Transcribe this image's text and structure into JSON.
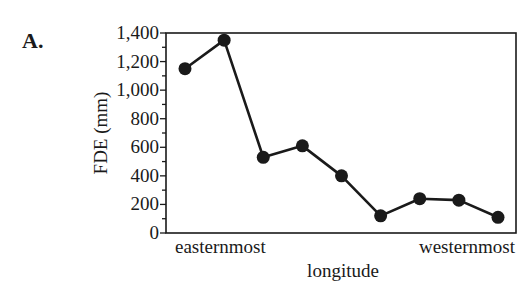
{
  "panel_label": "A.",
  "chart_data": {
    "type": "line",
    "title": "",
    "xlabel": "longitude",
    "ylabel": "FDE (mm)",
    "x_endpoint_labels": {
      "left": "easternmost",
      "right": "westernmost"
    },
    "x": [
      1,
      2,
      3,
      4,
      5,
      6,
      7,
      8,
      9
    ],
    "values": [
      1150,
      1350,
      530,
      610,
      400,
      120,
      240,
      230,
      110
    ],
    "ylim": [
      0,
      1400
    ],
    "yticks": [
      0,
      200,
      400,
      600,
      800,
      1000,
      1200,
      1400
    ],
    "ytick_labels": [
      "0",
      "200",
      "400",
      "600",
      "800",
      "1,000",
      "1,200",
      "1,400"
    ],
    "minor_ytick_step": 100,
    "grid": false,
    "legend": null,
    "marker": "filled-circle",
    "line_color": "#1a1a1a"
  }
}
